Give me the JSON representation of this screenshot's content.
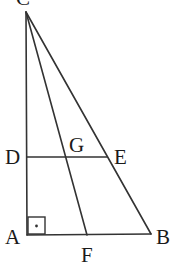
{
  "diagram": {
    "type": "geometry",
    "stroke_color": "#333333",
    "points": {
      "C": {
        "label": "C",
        "x": 26,
        "y": 12
      },
      "A": {
        "label": "A",
        "x": 27,
        "y": 235
      },
      "B": {
        "label": "B",
        "x": 151,
        "y": 234
      },
      "D": {
        "label": "D",
        "x": 27,
        "y": 157
      },
      "E": {
        "label": "E",
        "x": 107,
        "y": 157
      },
      "F": {
        "label": "F",
        "x": 87,
        "y": 235
      },
      "G": {
        "label": "G",
        "x": 66,
        "y": 157
      }
    },
    "segments": [
      "CA",
      "CB",
      "AB",
      "CF",
      "DE"
    ],
    "right_angle_at": "A",
    "labels": {
      "C": "C",
      "D": "D",
      "G": "G",
      "E": "E",
      "A": "A",
      "F": "F",
      "B": "B"
    }
  }
}
